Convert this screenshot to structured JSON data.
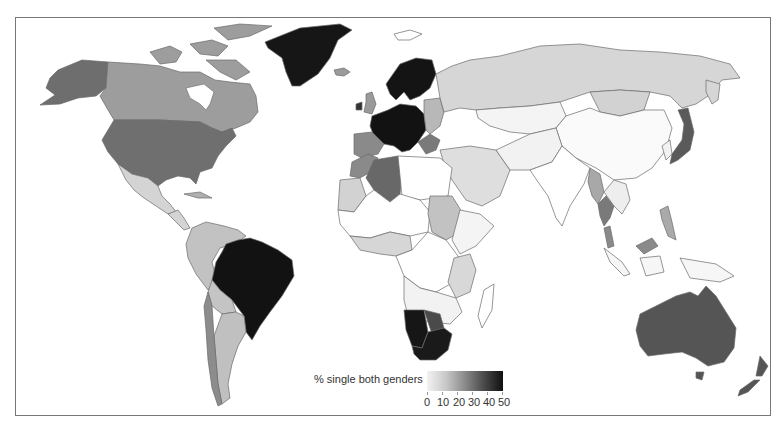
{
  "figure": {
    "type": "choropleth world map",
    "legend": {
      "title": "% single both genders",
      "ticks": [
        "0",
        "10",
        "20",
        "30",
        "40",
        "50"
      ],
      "range": [
        0,
        50
      ],
      "colors": {
        "low": "#f2f2f2",
        "high": "#101010"
      }
    }
  },
  "regions": {
    "north_america": {
      "Canada": "mid-light",
      "USA": "dark",
      "Alaska": "dark",
      "Mexico": "light",
      "Greenland": "very-dark"
    },
    "south_america": {
      "Brazil": "very-dark",
      "Argentina": "light",
      "Chile": "mid",
      "Peru": "light",
      "Colombia": "light",
      "Venezuela": "light",
      "Bolivia": "light",
      "Paraguay": "light"
    },
    "europe": {
      "Scandinavia": "very-dark",
      "Western Europe": "very-dark",
      "UK": "mid-light",
      "Spain": "mid",
      "Eastern Europe": "mid-light"
    },
    "africa": {
      "Algeria": "dark",
      "Morocco": "mid",
      "South Africa": "very-dark",
      "Namibia": "very-dark",
      "Botswana": "dark",
      "Sudan": "light",
      "others": "light/white"
    },
    "asia": {
      "Russia": "light",
      "Mongolia": "light",
      "China": "white",
      "Japan": "dark",
      "Thailand": "mid",
      "Myanmar": "mid-light",
      "Malaysia": "mid"
    },
    "oceania": {
      "Australia": "dark",
      "New Zealand": "dark"
    }
  }
}
